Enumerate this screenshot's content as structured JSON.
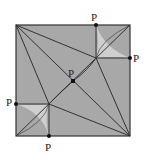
{
  "diagram": {
    "type": "geometric-square-partition",
    "fill_color": "#a8a8a8",
    "light_region_color": "#cfcfcf",
    "line_color": "#333333",
    "labels": [
      {
        "text": "P",
        "x": 91,
        "y": 12
      },
      {
        "text": "P",
        "x": 133,
        "y": 53
      },
      {
        "text": "P",
        "x": 68,
        "y": 68
      },
      {
        "text": "P",
        "x": 6,
        "y": 97
      },
      {
        "text": "P",
        "x": 45,
        "y": 142
      }
    ]
  }
}
